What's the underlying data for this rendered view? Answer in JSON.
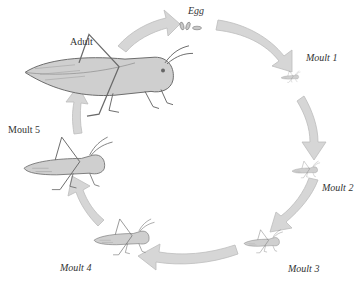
{
  "colors": {
    "arrow_fill": "#d6d6d6",
    "arrow_stroke": "#bdbdbd",
    "insect_fill": "#cfcfcf",
    "insect_stroke": "#6a6a6a",
    "text": "#333333"
  },
  "stages": [
    {
      "id": "egg",
      "label": "Egg"
    },
    {
      "id": "moult1",
      "label": "Moult 1"
    },
    {
      "id": "moult2",
      "label": "Moult 2"
    },
    {
      "id": "moult3",
      "label": "Moult 3"
    },
    {
      "id": "moult4",
      "label": "Moult 4"
    },
    {
      "id": "moult5",
      "label": "Moult 5"
    },
    {
      "id": "adult",
      "label": "Adult"
    }
  ]
}
